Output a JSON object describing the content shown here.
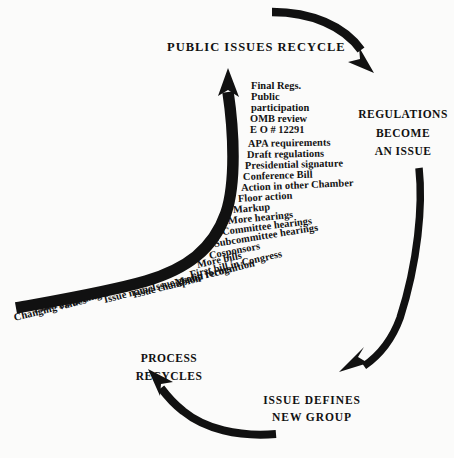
{
  "diagram": {
    "title": "Public Issues Recycle",
    "type": "cycle-diagram",
    "background_color": "#fbfbfa",
    "ink_color": "#111111"
  },
  "headings": {
    "top": "PUBLIC  ISSUES  RECYCLE",
    "right": [
      "REGULATIONS",
      "BECOME",
      "AN ISSUE"
    ],
    "bottom_right": [
      "ISSUE  DEFINES",
      "NEW  GROUP"
    ],
    "bottom_left": [
      "PROCESS",
      "RECYCLES"
    ]
  },
  "steps": [
    {
      "label": "Final Regs.",
      "x": 251,
      "y": 86,
      "rot": 0
    },
    {
      "label": "Public",
      "x": 251,
      "y": 97,
      "rot": 0
    },
    {
      "label": "participation",
      "x": 251,
      "y": 108,
      "rot": 0
    },
    {
      "label": "OMB review",
      "x": 250,
      "y": 119,
      "rot": 0
    },
    {
      "label": "E O # 12291",
      "x": 250,
      "y": 130,
      "rot": 0
    },
    {
      "label": "APA requirements",
      "x": 248,
      "y": 144,
      "rot": -1
    },
    {
      "label": "Draft regulations",
      "x": 247,
      "y": 155,
      "rot": -1
    },
    {
      "label": "Presidential signature",
      "x": 245,
      "y": 166,
      "rot": -1.5
    },
    {
      "label": "Conference Bill",
      "x": 243,
      "y": 177,
      "rot": -2
    },
    {
      "label": "Action in other Chamber",
      "x": 241,
      "y": 188,
      "rot": -2.5
    },
    {
      "label": "Floor action",
      "x": 238,
      "y": 199,
      "rot": -3.5
    },
    {
      "label": "Markup",
      "x": 233,
      "y": 210,
      "rot": -4.5
    },
    {
      "label": "More hearings",
      "x": 228,
      "y": 221,
      "rot": -5.5
    },
    {
      "label": "Committee hearings",
      "x": 222,
      "y": 232,
      "rot": -7
    },
    {
      "label": "Subcommittee hearings",
      "x": 214,
      "y": 244,
      "rot": -9
    },
    {
      "label": "Cosponsors",
      "x": 209,
      "y": 256,
      "rot": -11
    },
    {
      "label": "More bills",
      "x": 197,
      "y": 265,
      "rot": -12
    },
    {
      "label": "First bill in Congress",
      "x": 190,
      "y": 275,
      "rot": -13
    },
    {
      "label": "Media recognition",
      "x": 175,
      "y": 283,
      "rot": -14
    },
    {
      "label": "Issue group forms",
      "x": 152,
      "y": 288,
      "rot": -14
    },
    {
      "label": "Issue champion",
      "x": 133,
      "y": 295,
      "rot": -14
    },
    {
      "label": "Issue name",
      "x": 104,
      "y": 300,
      "rot": -14
    },
    {
      "label": "Defining event",
      "x": 64,
      "y": 304,
      "rot": -14
    },
    {
      "label": "Emerging issues",
      "x": 34,
      "y": 310,
      "rot": -14
    },
    {
      "label": "Changing values",
      "x": 14,
      "y": 318,
      "rot": -14
    }
  ],
  "arrows": [
    {
      "name": "main-process-arrow",
      "direction": "up",
      "from": "bottom-left",
      "to": "top-center"
    },
    {
      "name": "top-right-arrow",
      "direction": "down-right",
      "from": "top-center",
      "to": "upper-right"
    },
    {
      "name": "right-down-arrow",
      "direction": "down-left",
      "from": "upper-right",
      "to": "lower-right"
    },
    {
      "name": "bottom-left-arrow",
      "direction": "up-left",
      "from": "lower-right",
      "to": "bottom-left"
    }
  ]
}
